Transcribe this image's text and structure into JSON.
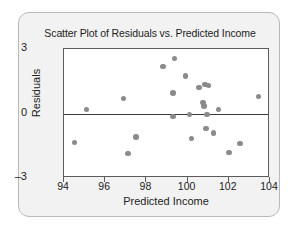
{
  "chart_data": {
    "type": "scatter",
    "title": "Scatter Plot of Residuals vs. Predicted Income",
    "xlabel": "Predicted Income",
    "ylabel": "Residuals",
    "xlim": [
      94,
      104
    ],
    "ylim": [
      -3,
      3
    ],
    "xticks": [
      94,
      96,
      98,
      100,
      102,
      104
    ],
    "yticks": [
      3,
      0,
      -3
    ],
    "grid": false,
    "legend": null,
    "reference_line": {
      "axis": "y",
      "value": 0
    },
    "point_color": "#8b8b8b",
    "points": [
      {
        "x": 94.5,
        "y": -1.35
      },
      {
        "x": 95.1,
        "y": 0.2
      },
      {
        "x": 96.9,
        "y": 0.7
      },
      {
        "x": 97.1,
        "y": -1.85
      },
      {
        "x": 97.5,
        "y": -1.1
      },
      {
        "x": 98.8,
        "y": 2.2
      },
      {
        "x": 99.35,
        "y": 2.55
      },
      {
        "x": 99.3,
        "y": 0.95
      },
      {
        "x": 99.3,
        "y": -0.15
      },
      {
        "x": 99.9,
        "y": 1.75
      },
      {
        "x": 100.1,
        "y": -0.05
      },
      {
        "x": 100.2,
        "y": -1.15
      },
      {
        "x": 100.55,
        "y": 1.2
      },
      {
        "x": 100.75,
        "y": 0.5
      },
      {
        "x": 100.8,
        "y": 0.35
      },
      {
        "x": 100.85,
        "y": 1.35
      },
      {
        "x": 101.0,
        "y": 1.3
      },
      {
        "x": 100.95,
        "y": -0.05
      },
      {
        "x": 100.9,
        "y": -0.7
      },
      {
        "x": 101.25,
        "y": -0.9
      },
      {
        "x": 101.5,
        "y": 0.2
      },
      {
        "x": 102.0,
        "y": -1.8
      },
      {
        "x": 102.55,
        "y": -1.4
      },
      {
        "x": 103.45,
        "y": 0.8
      }
    ]
  }
}
